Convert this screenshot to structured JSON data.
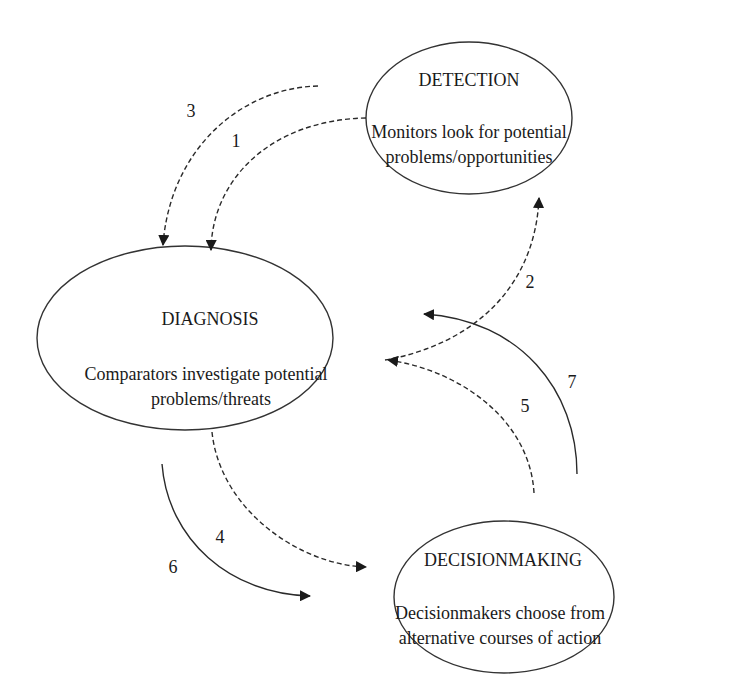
{
  "diagram": {
    "type": "process-cycle",
    "nodes": [
      {
        "id": "detection",
        "title": "DETECTION",
        "description_lines": [
          "Monitors look for potential",
          "problems/opportunities"
        ]
      },
      {
        "id": "diagnosis",
        "title": "DIAGNOSIS",
        "description_lines": [
          "Comparators investigate potential",
          "problems/threats"
        ]
      },
      {
        "id": "decisionmaking",
        "title": "DECISIONMAKING",
        "description_lines": [
          "Decisionmakers choose from",
          "alternative courses of action"
        ]
      }
    ],
    "edges": [
      {
        "label": "1",
        "from": "detection",
        "to": "diagnosis",
        "style": "dashed"
      },
      {
        "label": "2",
        "from": "diagnosis",
        "to": "detection",
        "style": "dashed"
      },
      {
        "label": "3",
        "from": "external",
        "to": "diagnosis",
        "style": "dashed"
      },
      {
        "label": "4",
        "from": "diagnosis",
        "to": "decisionmaking",
        "style": "dashed"
      },
      {
        "label": "5",
        "from": "decisionmaking",
        "to": "diagnosis",
        "style": "dashed"
      },
      {
        "label": "6",
        "from": "diagnosis",
        "to": "decisionmaking",
        "style": "solid"
      },
      {
        "label": "7",
        "from": "decisionmaking",
        "to": "diagnosis",
        "style": "solid"
      }
    ],
    "colors": {
      "stroke": "#333333",
      "text": "#1a1a1a",
      "background": "#ffffff"
    }
  }
}
